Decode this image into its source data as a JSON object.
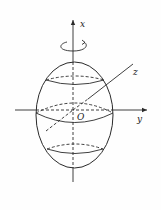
{
  "diagram": {
    "type": "ellipsoid-of-revolution",
    "labels": {
      "x_axis": "x",
      "y_axis": "y",
      "z_axis": "z",
      "origin": "O"
    },
    "colors": {
      "stroke": "#2a2a2a",
      "background": "#fefefe"
    }
  }
}
